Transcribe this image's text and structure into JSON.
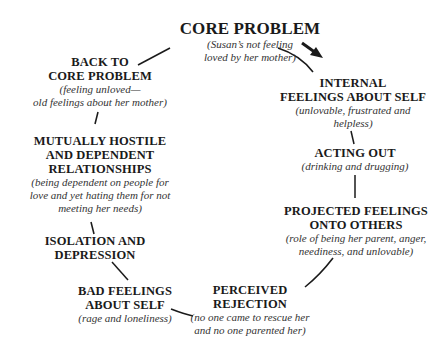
{
  "diagram": {
    "type": "cycle",
    "nodes": [
      {
        "id": "core",
        "title": [
          "CORE PROBLEM"
        ],
        "subtitle": [
          "(Susan’s not feeling",
          "loved by her mother)"
        ]
      },
      {
        "id": "internal",
        "title": [
          "INTERNAL",
          "FEELINGS ABOUT SELF"
        ],
        "subtitle": [
          "(unlovable, frustrated and",
          "helpless)"
        ]
      },
      {
        "id": "acting",
        "title": [
          "ACTING OUT"
        ],
        "subtitle": [
          "(drinking and drugging)"
        ]
      },
      {
        "id": "projected",
        "title": [
          "PROJECTED FEELINGS",
          "ONTO OTHERS"
        ],
        "subtitle": [
          "(role of being her parent, anger,",
          "neediness, and unlovable)"
        ]
      },
      {
        "id": "rejection",
        "title": [
          "PERCEIVED",
          "REJECTION"
        ],
        "subtitle": [
          "(no one came to rescue her",
          "and no one parented her)"
        ]
      },
      {
        "id": "bad",
        "title": [
          "BAD FEELINGS",
          "ABOUT SELF"
        ],
        "subtitle": [
          "(rage and loneliness)"
        ]
      },
      {
        "id": "isolation",
        "title": [
          "ISOLATION AND",
          "DEPRESSION"
        ],
        "subtitle": []
      },
      {
        "id": "mutual",
        "title": [
          "MUTUALLY HOSTILE",
          "AND DEPENDENT",
          "RELATIONSHIPS"
        ],
        "subtitle": [
          "(being dependent on people for",
          "love and yet  hating them for not",
          "meeting her needs)"
        ]
      },
      {
        "id": "back",
        "title": [
          "BACK TO",
          "CORE PROBLEM"
        ],
        "subtitle": [
          "(feeling unloved—",
          "old feelings about her mother)"
        ]
      }
    ],
    "direction_arrow": "clockwise-arrow",
    "colors": {
      "text": "#1a1a1a",
      "lines": "#1a1a1a",
      "background": "#ffffff"
    }
  }
}
